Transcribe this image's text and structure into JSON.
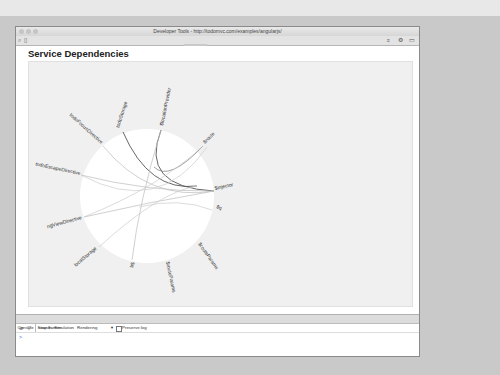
{
  "window": {
    "title": "Developer Tools - http://todomvc.com/examples/angularjs/"
  },
  "toolbar": {
    "tabs": [
      "Elements",
      "Network",
      "Sources",
      "Timeline",
      "Profiles",
      "Resources",
      "Audits",
      "Console",
      "AngularJS"
    ],
    "active_tab": "AngularJS",
    "icons": [
      "search-icon",
      "device-icon",
      "drawer-icon",
      "gear-icon",
      "dock-icon"
    ]
  },
  "page": {
    "title": "Service Dependencies"
  },
  "diagram": {
    "type": "chord",
    "nodes": [
      {
        "label": "todoStorage",
        "angle": -108
      },
      {
        "label": "$locationProvider",
        "angle": -75
      },
      {
        "label": "$route",
        "angle": -40
      },
      {
        "label": "$injector",
        "angle": -10
      },
      {
        "label": "$q",
        "angle": 22
      },
      {
        "label": "$route",
        "angle": 52
      },
      {
        "label": "$routeParams",
        "angle": 80
      },
      {
        "label": "$q",
        "angle": 100
      },
      {
        "label": "localStorage",
        "angle": 130
      },
      {
        "label": "ngViewDirective",
        "angle": 165
      },
      {
        "label": "todoEscapeDirective",
        "angle": 192
      },
      {
        "label": "todoFocusDirective",
        "angle": 222
      }
    ]
  },
  "drawer": {
    "tabs": [
      "Console",
      "Search",
      "Emulation",
      "Rendering"
    ],
    "active_tab": "Console",
    "frame_select": "<top frame>",
    "preserve_log_label": "Preserve log",
    "prompt": ">"
  },
  "colors": {
    "panel_bg": "#f0f0f0",
    "circle_fill": "#ffffff",
    "chord_dark": "#555555",
    "chord_light": "#bdbdbd"
  }
}
